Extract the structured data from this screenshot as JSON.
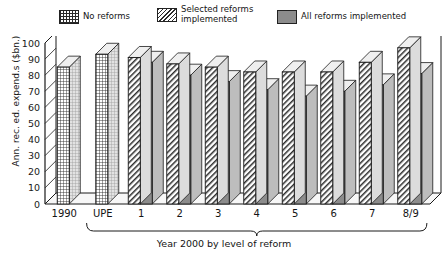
{
  "legend": {
    "items": [
      {
        "label": "No reforms",
        "pattern": "grid",
        "name": "no-reforms"
      },
      {
        "label": "Selected reforms\nimplemented",
        "pattern": "diag",
        "name": "selected-reforms"
      },
      {
        "label": "All reforms implemented",
        "pattern": "solid",
        "name": "all-reforms"
      }
    ]
  },
  "chart_data": {
    "type": "bar",
    "title": "",
    "xlabel": "Year 2000 by level of reform",
    "ylabel": "Ann. rec. ed. expend.s ($bn.)",
    "ylim": [
      0,
      100
    ],
    "yticks": [
      0,
      10,
      20,
      30,
      40,
      50,
      60,
      70,
      80,
      90,
      100
    ],
    "categories": [
      "1990",
      "UPE",
      "1",
      "2",
      "3",
      "4",
      "5",
      "6",
      "7",
      "8/9"
    ],
    "grid": false,
    "legend_position": "top",
    "series": [
      {
        "name": "No reforms",
        "pattern": "grid",
        "values": [
          85,
          93,
          null,
          null,
          null,
          null,
          null,
          null,
          null,
          null
        ]
      },
      {
        "name": "Selected reforms implemented",
        "pattern": "diag",
        "values": [
          null,
          null,
          91,
          87,
          85,
          82,
          82,
          82,
          88,
          97
        ]
      },
      {
        "name": "All reforms implemented",
        "pattern": "solid",
        "values": [
          null,
          null,
          88,
          80,
          76,
          71,
          67,
          70,
          74,
          81
        ]
      }
    ],
    "bracket": {
      "label": "Year 2000 by level of reform",
      "from_category": "UPE",
      "to_category": "8/9"
    }
  },
  "colors": {
    "axis": "#1a1a1a",
    "solid_fill": "#8c8c8c",
    "bar_side": "#d8d8d8",
    "bar_top": "#efefef",
    "background": "#ffffff"
  }
}
